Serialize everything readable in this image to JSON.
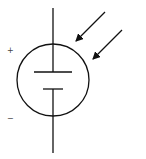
{
  "diagram": {
    "type": "circuit-symbol",
    "symbol": "photovoltaic-cell",
    "labels": {
      "positive": "+",
      "negative": "−"
    },
    "colors": {
      "stroke": "#111111",
      "background": "#ffffff",
      "label": "#444444"
    }
  }
}
